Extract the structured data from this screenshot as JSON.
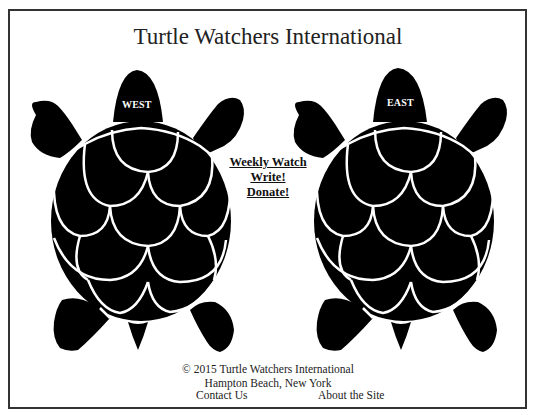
{
  "header": {
    "title": "Turtle Watchers International"
  },
  "turtles": [
    {
      "id": "west",
      "label": "WEST"
    },
    {
      "id": "east",
      "label": "EAST"
    }
  ],
  "nav": {
    "links": [
      {
        "label": "Weekly Watch"
      },
      {
        "label": "Write!"
      },
      {
        "label": "Donate!"
      }
    ]
  },
  "footer": {
    "copyright": "© 2015 Turtle Watchers International",
    "location": "Hampton Beach, New York",
    "contact_label": "Contact Us",
    "about_label": "About the Site"
  },
  "colors": {
    "turtle": "#000000",
    "background": "#ffffff",
    "border": "#333333"
  }
}
